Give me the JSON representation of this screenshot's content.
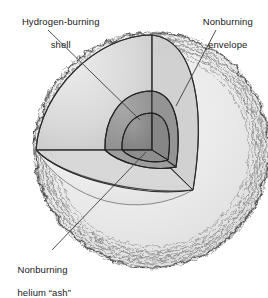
{
  "figure": {
    "type": "cutaway-cross-section-diagram",
    "canvas": {
      "width": 268,
      "height": 287
    },
    "background_color": "#ffffff"
  },
  "labels": {
    "hydrogen_shell": {
      "line1": "Hydrogen-burning",
      "line2": "shell",
      "leader_from": [
        92,
        30
      ],
      "leader_to": [
        140,
        118
      ]
    },
    "nonburning_envelope": {
      "line1": "Nonburning",
      "line2": "envelope",
      "leader_from": [
        217,
        30
      ],
      "leader_to": [
        176,
        106
      ]
    },
    "nonburning_helium_ash": {
      "line1": "Nonburning",
      "line2": "helium “ash”",
      "leader_from": [
        52,
        250
      ],
      "leader_to": [
        143,
        152
      ]
    }
  },
  "regions": [
    {
      "name": "nonburning-envelope-outer-sphere",
      "fill": "#e9e9e9",
      "edge": "granulated-fuzzy",
      "stroke": "#4a4a4a"
    },
    {
      "name": "cutaway-wedge-outer-face",
      "fill": "#dcdcdc",
      "stroke": "#3a3a3a"
    },
    {
      "name": "hydrogen-burning-shell",
      "fill": "#9b9b9b",
      "stroke": "#2e2e2e"
    },
    {
      "name": "nonburning-helium-ash-core",
      "fill": "#8a8a8a",
      "stroke": "#2e2e2e"
    },
    {
      "name": "cut-plane-floor",
      "fill": "#efefef",
      "stroke": "#5a5a5a"
    }
  ],
  "colors": {
    "envelope": "#e9e9e9",
    "wedge_face": "#dcdcdc",
    "shell": "#9b9b9b",
    "core": "#8a8a8a",
    "outline": "#2e2e2e",
    "leader_line": "#3c3c3c",
    "text": "#1a1a1a"
  },
  "geometry": {
    "sphere_center": [
      152,
      150
    ],
    "sphere_radius": 118,
    "wedge_apex": [
      152,
      150
    ],
    "wedge_top_vertex": [
      152,
      35
    ],
    "wedge_left_vertex": [
      36,
      150
    ],
    "wedge_bottom_right_vertex": [
      193,
      190
    ]
  }
}
